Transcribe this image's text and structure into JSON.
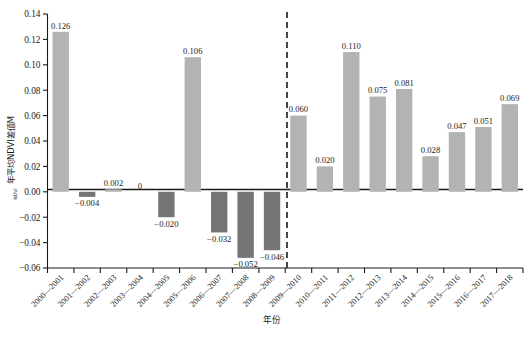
{
  "chart_data": {
    "type": "bar",
    "title": "",
    "xlabel": "年份",
    "ylabel": "年平均NDVI差值M",
    "ylabel_sub": "NDVI",
    "ylim": [
      -0.06,
      0.14
    ],
    "ytick_step": 0.02,
    "yticks": [
      "0.14",
      "0.12",
      "0.10",
      "0.08",
      "0.06",
      "0.04",
      "0.02",
      "0.00",
      "-0.02",
      "-0.04",
      "-0.06"
    ],
    "ytick_values": [
      0.14,
      0.12,
      0.1,
      0.08,
      0.06,
      0.04,
      0.02,
      0.0,
      -0.02,
      -0.04,
      -0.06
    ],
    "grid": false,
    "legend": "none",
    "categories": [
      "2000-2001",
      "2001-2002",
      "2002-2003",
      "2003-2004",
      "2004-2005",
      "2005-2006",
      "2006-2007",
      "2007-2008",
      "2008-2009",
      "2009-2010",
      "2010-2011",
      "2011-2012",
      "2012-2013",
      "2013-2014",
      "2014-2015",
      "2015-2016",
      "2016-2017",
      "2017-2018"
    ],
    "values": [
      0.126,
      -0.004,
      0.002,
      0,
      -0.02,
      0.106,
      -0.032,
      -0.052,
      -0.046,
      0.06,
      0.02,
      0.11,
      0.075,
      0.081,
      0.028,
      0.047,
      0.051,
      0.069
    ],
    "value_labels": [
      "0.126",
      "-0.004",
      "0.002",
      "0",
      "-0.020",
      "0.106",
      "-0.032",
      "-0.052",
      "-0.046",
      "0.060",
      "0.020",
      "0.110",
      "0.075",
      "0.081",
      "0.028",
      "0.047",
      "0.051",
      "0.069"
    ],
    "annotations": [
      {
        "type": "vertical-dashed-line",
        "after_category": "2008-2009",
        "label": ""
      }
    ],
    "colors": {
      "positive_bar": "#b3b3b3",
      "negative_bar": "#757575",
      "axis": "#1a1a1a",
      "text": "#1a1a1a",
      "divider": "#1a1a1a"
    }
  },
  "caption": {
    "text": ""
  }
}
